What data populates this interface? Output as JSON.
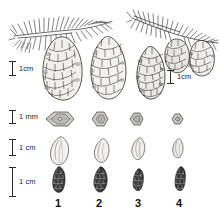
{
  "figure": {
    "type": "botanical-comparison-plate",
    "background_color": "#ffffff",
    "ink_color": "#2b2b2b",
    "columns": [
      {
        "number": "1"
      },
      {
        "number": "2"
      },
      {
        "number": "3"
      },
      {
        "number": "4"
      }
    ],
    "column_labels": [
      "1",
      "2",
      "3",
      "4"
    ],
    "scale_bars": [
      {
        "id": "cone-scale-left",
        "label": "1cm",
        "unit": "cm",
        "value": 1,
        "orientation": "vertical"
      },
      {
        "id": "cone-scale-right",
        "label": "1cm",
        "unit": "cm",
        "value": 1,
        "orientation": "vertical"
      },
      {
        "id": "row-scale-mm",
        "label": "1 mm",
        "unit": "mm",
        "value": 1,
        "orientation": "vertical"
      },
      {
        "id": "row-scale-seed",
        "label": "1 cm",
        "unit": "cm",
        "value": 1,
        "orientation": "vertical"
      },
      {
        "id": "row-scale-young",
        "label": "1 cm",
        "unit": "cm",
        "value": 1,
        "orientation": "vertical"
      }
    ],
    "rows": [
      {
        "id": "row-cones",
        "content": "mature cones and needled branchlets",
        "specimens": [
          "branch-with-pendent-cone",
          "mature-cone-2",
          "mature-cone-3",
          "branch-with-two-cones"
        ]
      },
      {
        "id": "row-cone-scales",
        "content": "cone scales / pollen-grain view, rhombic outline",
        "specimens": [
          "scale-1",
          "scale-2",
          "scale-3",
          "scale-4"
        ]
      },
      {
        "id": "row-seeds",
        "content": "winged seeds, pale teardrop outline",
        "specimens": [
          "seed-1",
          "seed-2",
          "seed-3",
          "seed-4"
        ]
      },
      {
        "id": "row-young-cones",
        "content": "immature dark cones",
        "specimens": [
          "young-cone-1",
          "young-cone-2",
          "young-cone-3",
          "young-cone-4"
        ]
      }
    ]
  }
}
